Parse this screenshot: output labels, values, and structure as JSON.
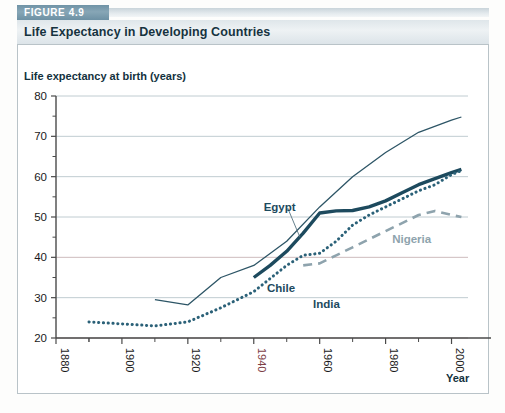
{
  "figure": {
    "badge": "FIGURE 4.9",
    "title": "Life Expectancy in Developing Countries"
  },
  "axes": {
    "y_axis_title": "Life expectancy at birth (years)",
    "x_axis_title": "Year",
    "y_ticks": [
      "20",
      "30",
      "40",
      "50",
      "60",
      "70",
      "80"
    ],
    "x_ticks": [
      "1880",
      "1900",
      "1920",
      "1940",
      "1960",
      "1980",
      "2000"
    ]
  },
  "labels": {
    "chile": "Chile",
    "egypt": "Egypt",
    "india": "India",
    "nigeria": "Nigeria"
  },
  "colors": {
    "badge_bg": "#7395a7",
    "title_bar_bg": "#e3eaee",
    "accent_rule": "#7e9cae",
    "chile_line": "#2d5566",
    "egypt_line": "#1d4a5e",
    "india_line": "#2b6178",
    "nigeria_line": "#8ea3ad",
    "grid": "#b9c6cc",
    "axis": "#4a4a4a",
    "tick_highlight": "#7d4047"
  },
  "chart_data": {
    "type": "line",
    "title": "Life Expectancy in Developing Countries",
    "xlabel": "Year",
    "ylabel": "Life expectancy at birth (years)",
    "xlim": [
      1880,
      2005
    ],
    "ylim": [
      20,
      80
    ],
    "grid": true,
    "legend": "inline-annotations",
    "y_tick_values": [
      20,
      30,
      40,
      50,
      60,
      70,
      80
    ],
    "y_minor_tick_values": [
      25,
      35,
      45,
      55,
      65,
      75
    ],
    "x_tick_values": [
      1880,
      1900,
      1920,
      1940,
      1960,
      1980,
      2000
    ],
    "series": [
      {
        "name": "Chile",
        "style": "solid-thin",
        "color": "#2d5566",
        "x": [
          1910,
          1920,
          1930,
          1940,
          1950,
          1960,
          1970,
          1980,
          1990,
          2000,
          2003
        ],
        "y": [
          29.5,
          28.2,
          35.0,
          38.0,
          44.0,
          52.5,
          60.0,
          66.0,
          71.0,
          74.0,
          74.8
        ]
      },
      {
        "name": "Egypt",
        "style": "solid-thick",
        "color": "#1d4a5e",
        "x": [
          1940,
          1945,
          1950,
          1955,
          1960,
          1965,
          1970,
          1975,
          1980,
          1985,
          1990,
          1995,
          2000,
          2003
        ],
        "y": [
          35.0,
          38.0,
          41.5,
          46.0,
          51.0,
          51.5,
          51.6,
          52.5,
          54.0,
          56.0,
          58.0,
          59.5,
          61.0,
          61.8
        ]
      },
      {
        "name": "India",
        "style": "dotted",
        "color": "#2b6178",
        "x": [
          1890,
          1900,
          1910,
          1920,
          1930,
          1940,
          1950,
          1955,
          1960,
          1965,
          1970,
          1975,
          1980,
          1985,
          1990,
          1995,
          2000,
          2003
        ],
        "y": [
          24.0,
          23.5,
          23.0,
          24.0,
          27.5,
          31.5,
          38.0,
          40.5,
          41.0,
          44.0,
          48.0,
          50.5,
          52.5,
          54.5,
          56.5,
          58.0,
          60.5,
          61.5
        ]
      },
      {
        "name": "Nigeria",
        "style": "dashed",
        "color": "#8ea3ad",
        "x": [
          1955,
          1960,
          1965,
          1970,
          1975,
          1980,
          1985,
          1990,
          1995,
          2000,
          2003
        ],
        "y": [
          38.0,
          38.5,
          40.5,
          42.5,
          44.5,
          46.5,
          48.5,
          50.5,
          51.5,
          50.5,
          50.0
        ]
      }
    ],
    "annotations": [
      {
        "text": "Chile",
        "x": 1944,
        "y": 32.5
      },
      {
        "text": "Egypt",
        "x": 1943,
        "y": 52.5,
        "leader_to": {
          "x": 1954,
          "y": 45.0
        }
      },
      {
        "text": "India",
        "x": 1958,
        "y": 28.5
      },
      {
        "text": "Nigeria",
        "x": 1982,
        "y": 44.5
      }
    ]
  }
}
